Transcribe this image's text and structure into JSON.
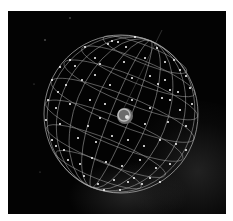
{
  "image": {
    "subject": "celestial sphere wireframe with stars surrounding a central planet",
    "background_color": "#030303",
    "grid_color": "#bdbdbd",
    "star_color": "#ffffff"
  }
}
